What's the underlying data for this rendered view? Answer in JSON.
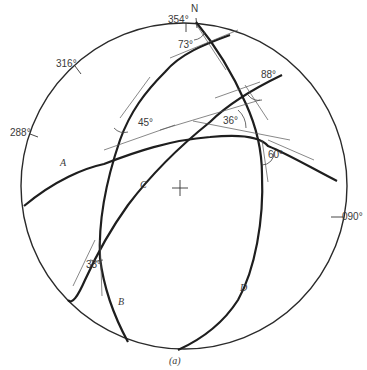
{
  "figure": {
    "caption": "(a)",
    "north_label": "N",
    "azimuth_labels": [
      {
        "text": "354°",
        "x": 168,
        "y": 23
      },
      {
        "text": "316°",
        "x": 56,
        "y": 67
      },
      {
        "text": "288°",
        "x": 10,
        "y": 136
      },
      {
        "text": "090°",
        "x": 342,
        "y": 216
      }
    ],
    "great_circles": [
      {
        "name": "A",
        "label_x": 60,
        "label_y": 166
      },
      {
        "name": "B",
        "label_x": 117,
        "label_y": 304
      },
      {
        "name": "C",
        "label_x": 140,
        "label_y": 188
      },
      {
        "name": "D",
        "label_x": 240,
        "label_y": 290
      }
    ],
    "angles": [
      {
        "text": "73°",
        "x": 178,
        "y": 48
      },
      {
        "text": "88°",
        "x": 261,
        "y": 78
      },
      {
        "text": "45°",
        "x": 138,
        "y": 125
      },
      {
        "text": "36°",
        "x": 223,
        "y": 123
      },
      {
        "text": "60°",
        "x": 269,
        "y": 156
      },
      {
        "text": "33°",
        "x": 86,
        "y": 268
      }
    ],
    "colors": {
      "line": "#1e1e1e",
      "text": "#3a3a3a",
      "background": "#ffffff"
    }
  }
}
